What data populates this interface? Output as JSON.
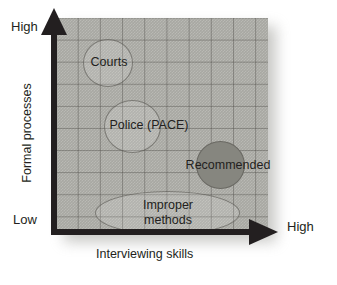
{
  "chart_data": {
    "type": "scatter",
    "title": "",
    "xlabel": "Interviewing skills",
    "ylabel": "Formal processes",
    "x_axis": {
      "low_label": "Low",
      "high_label": "High",
      "arrow": true
    },
    "y_axis": {
      "low_label": "Low",
      "high_label": "High",
      "arrow": true
    },
    "grid": true,
    "legend": "none",
    "bubbles": [
      {
        "label": "Courts",
        "x": 0.17,
        "y": 0.84,
        "size": "medium",
        "fill": "light"
      },
      {
        "label": "Police (PACE)",
        "x": 0.3,
        "y": 0.58,
        "size": "medium",
        "fill": "light"
      },
      {
        "label": "Recommended",
        "x": 0.75,
        "y": 0.37,
        "size": "medium",
        "fill": "dark"
      },
      {
        "label": "Improper methods",
        "x": 0.51,
        "y": 0.1,
        "size": "wide-ellipse",
        "fill": "light"
      }
    ]
  },
  "axes": {
    "y_high": "High",
    "y_low": "Low",
    "y_title": "Formal processes",
    "x_high": "High",
    "x_title": "Interviewing skills"
  },
  "bubbles": {
    "courts": "Courts",
    "police": "Police (PACE)",
    "recommended": "Recommended",
    "improper_line1": "Improper",
    "improper_line2": "methods",
    "improper_full": "Improper methods"
  },
  "colors": {
    "panel": "#a8a8a2",
    "grid_line": "#464440",
    "axis": "#231f20",
    "bubble_dark": "#86867f",
    "text": "#231f20",
    "background": "#ffffff"
  }
}
